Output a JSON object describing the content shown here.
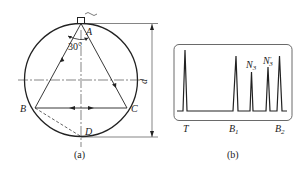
{
  "figure_a": {
    "caption": "(a)",
    "points": {
      "A": "A",
      "B": "B",
      "C": "C",
      "D": "D"
    },
    "angle_label": "30°",
    "dimension_label": "d"
  },
  "figure_b": {
    "caption": "(b)",
    "peak_labels": {
      "N3": "N",
      "N3_sub": "3",
      "N3p": "N",
      "N3p_sub": "3",
      "N3p_sup": "′"
    },
    "axis_labels": {
      "T": "T",
      "B1": "B",
      "B1_sub": "1",
      "B2": "B",
      "B2_sub": "2"
    }
  },
  "colors": {
    "line": "#222222",
    "background": "#ffffff"
  }
}
